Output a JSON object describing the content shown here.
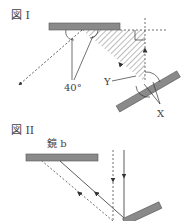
{
  "figure1": {
    "title": "図 I",
    "angle_label": "40°",
    "label_y": "Y",
    "label_x": "X"
  },
  "figure2": {
    "title": "図 II",
    "mirror_label": "鏡 b"
  },
  "colors": {
    "mirror": "#8a8a8a",
    "line": "#333333",
    "hatch": "#555555"
  }
}
